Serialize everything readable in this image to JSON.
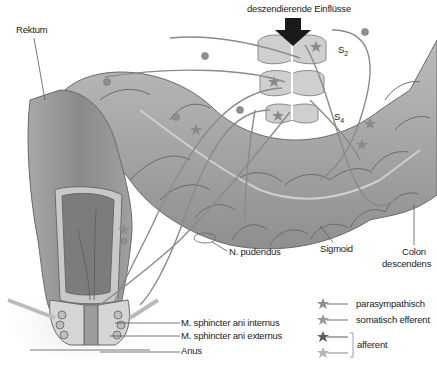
{
  "figure": {
    "title": "deszendierende Einflüsse",
    "colors": {
      "background": "#ffffff",
      "colon_fill": "#a9a9a9",
      "colon_dark": "#8e8e8e",
      "colon_outline": "#6a6a6a",
      "spinal_fill": "#cfcfcf",
      "nerve_line": "#8a8a8a",
      "arrow": "#1a1a1a",
      "label_text": "#222222"
    },
    "spinal_segments": [
      {
        "label": "S",
        "sub": "2"
      },
      {
        "label": "S",
        "sub": "3",
        "visible_label": false
      },
      {
        "label": "S",
        "sub": "4"
      }
    ],
    "labels": {
      "rektum": "Rektum",
      "n_pudendus": "N. pudendus",
      "sigmoid": "Sigmoid",
      "colon_line1": "Colon",
      "colon_line2": "descendens",
      "sphincter_internus": "M. sphincter ani internus",
      "sphincter_externus": "M. sphincter ani externus",
      "anus": "Anus"
    },
    "legend": {
      "items": [
        {
          "icon": "star-neuron-icon",
          "label": "parasympathisch",
          "color": "#8f8f8f"
        },
        {
          "icon": "star-neuron-icon",
          "label": "somatisch efferent",
          "color": "#9a9a9a"
        },
        {
          "icon": "star-neuron-icon",
          "label": "",
          "color": "#5e5e5e"
        },
        {
          "icon": "star-neuron-icon",
          "label": "",
          "color": "#b4b4b4"
        }
      ],
      "bracket_label": "afferent"
    }
  }
}
